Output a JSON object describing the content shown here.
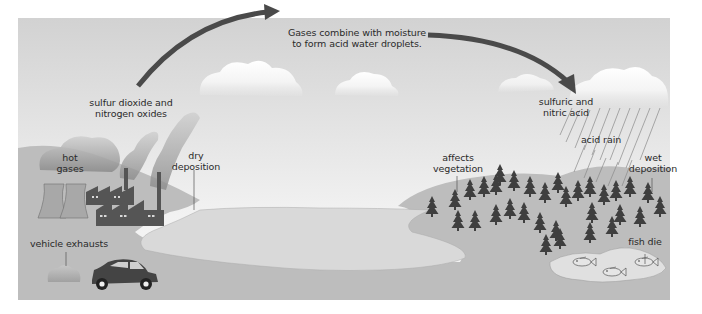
{
  "diagram": {
    "title_caption": "Gases combine with moisture\nto form acid water droplets.",
    "labels": {
      "emissions": "sulfur dioxide and\nnitrogen oxides",
      "hot_gases": "hot\ngases",
      "dry_deposition": "dry\ndeposition",
      "vehicle_exhausts": "vehicle exhausts",
      "acids": "sulfuric and\nnitric acid",
      "acid_rain": "acid rain",
      "affects_vegetation": "affects\nvegetation",
      "wet_deposition": "wet\ndeposition",
      "fish_die": "fish die"
    },
    "colors": {
      "sky_top": "#d4d4d4",
      "sky_bottom": "#f3f3f3",
      "land": "#bdbdbd",
      "water": "#d9d9d9",
      "arrow": "#4a4a4a",
      "tree": "#3f3f3f",
      "factory": "#555555",
      "car": "#444444"
    }
  }
}
